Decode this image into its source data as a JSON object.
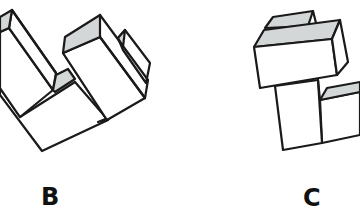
{
  "figures": [
    {
      "id": "B",
      "label": "B",
      "description": "Isometric 3D block assembly shaped like an L with two upright rectangular blocks"
    },
    {
      "id": "C",
      "label": "C",
      "description": "Isometric 3D block assembly with a horizontal box stacked on a vertical pillar and a step block to the right"
    }
  ],
  "colors": {
    "stroke": "#1a1a1a",
    "shaded_face": "#d4d7d7",
    "face": "#ffffff",
    "background": "#ffffff"
  }
}
